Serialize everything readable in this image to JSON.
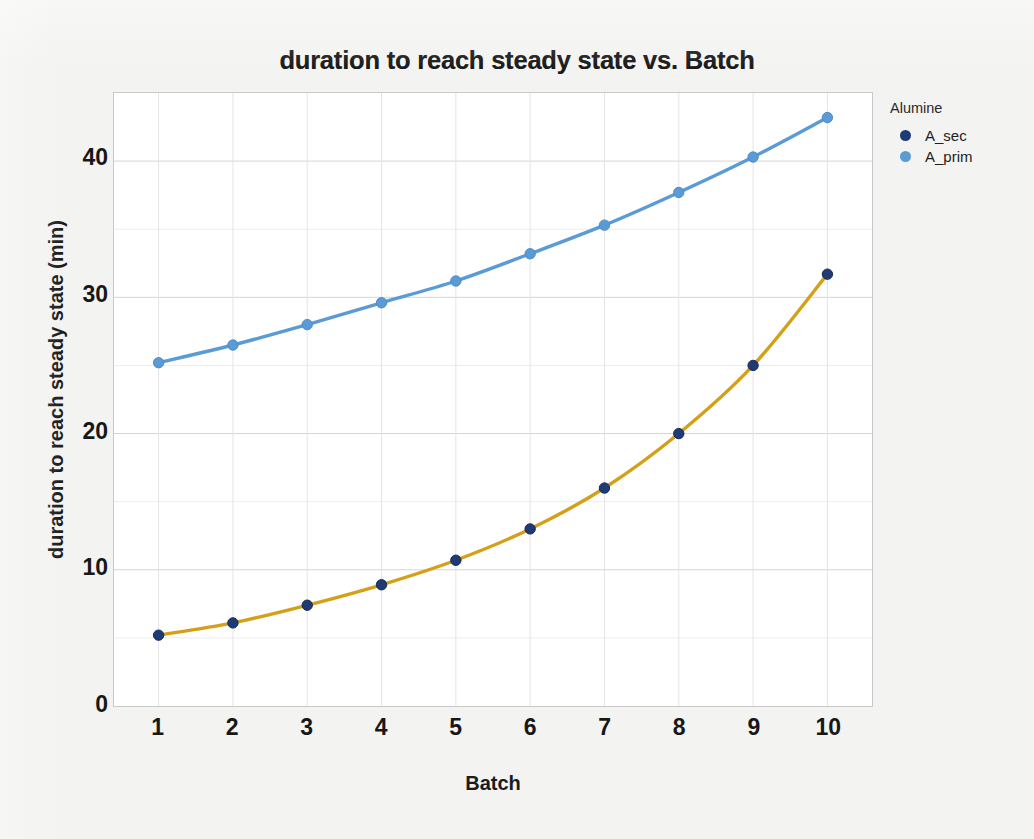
{
  "figure": {
    "background_color": "#f3f3f1",
    "plot_background_color": "#ffffff",
    "plot_border_color": "#c9c9c9"
  },
  "title": "duration to reach steady state vs. Batch",
  "axes": {
    "x_title": "Batch",
    "y_title": "duration to reach steady state (min)",
    "x_ticks": [
      "1",
      "2",
      "3",
      "4",
      "5",
      "6",
      "7",
      "8",
      "9",
      "10"
    ],
    "y_ticks": [
      "0",
      "10",
      "20",
      "30",
      "40"
    ]
  },
  "legend": {
    "title": "Alumine",
    "entries": [
      {
        "label": "A_sec",
        "marker_color": "#1f3b73"
      },
      {
        "label": "A_prim",
        "marker_color": "#5b9bd5"
      }
    ]
  },
  "chart_data": {
    "type": "line",
    "title": "duration to reach steady state vs. Batch",
    "xlabel": "Batch",
    "ylabel": "duration to reach steady state (min)",
    "xlim": [
      0.4,
      10.6
    ],
    "ylim": [
      0,
      45
    ],
    "x": [
      1,
      2,
      3,
      4,
      5,
      6,
      7,
      8,
      9,
      10
    ],
    "xtick_values": [
      1,
      2,
      3,
      4,
      5,
      6,
      7,
      8,
      9,
      10
    ],
    "ytick_values": [
      0,
      10,
      20,
      30,
      40
    ],
    "minor_ytick_values": [
      5,
      15,
      25,
      35
    ],
    "grid": true,
    "legend_position": "right",
    "legend_title": "Alumine",
    "series": [
      {
        "name": "A_sec",
        "line_color": "#d4a017",
        "marker_color": "#1f3b73",
        "values": [
          5.2,
          6.1,
          7.4,
          8.9,
          10.7,
          13.0,
          16.0,
          20.0,
          25.0,
          31.7
        ]
      },
      {
        "name": "A_prim",
        "line_color": "#5b9bd5",
        "marker_color": "#5b9bd5",
        "values": [
          25.2,
          26.5,
          28.0,
          29.6,
          31.2,
          33.2,
          35.3,
          37.7,
          40.3,
          43.2
        ]
      }
    ]
  }
}
